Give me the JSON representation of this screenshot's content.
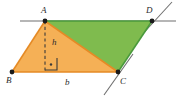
{
  "figure": {
    "name": "parallelogram-area-diagram",
    "background_color": "#ffffff"
  },
  "colors": {
    "orange_fill": "#f5b056",
    "orange_stroke": "#e58a25",
    "green_fill": "#7fbb4e",
    "green_stroke": "#4a9a3c",
    "guide_line": "#6f6f6f",
    "dashed_line": "#3a3a3a",
    "label_color": "#2b2b2b",
    "vertex_dot": "#1a1a1a"
  },
  "vertices": [
    {
      "id": "A",
      "label": "A",
      "x": 45,
      "y": 21
    },
    {
      "id": "B",
      "label": "B",
      "x": 12,
      "y": 72
    },
    {
      "id": "C",
      "label": "C",
      "x": 118,
      "y": 72
    },
    {
      "id": "D",
      "label": "D",
      "x": 152,
      "y": 21
    }
  ],
  "measures": {
    "height_label": "h",
    "base_label": "b",
    "foot_point": {
      "x": 45,
      "y": 72
    },
    "right_angle_marker": true
  },
  "regions": [
    {
      "id": "triangle-abc",
      "label": "A",
      "fill": "#f5b056",
      "points": "45,21 12,72 118,72"
    },
    {
      "id": "triangle-acd",
      "label": "D",
      "fill": "#7fbb4e",
      "points": "45,21 118,72 152,21"
    }
  ],
  "guides": [
    {
      "id": "top-line",
      "x1": 20,
      "y1": 21,
      "x2": 176,
      "y2": 21
    },
    {
      "id": "line-through-c",
      "x1": 104,
      "y1": 95,
      "x2": 133,
      "y2": 54
    },
    {
      "id": "line-through-d",
      "x1": 139,
      "y1": 38,
      "x2": 172,
      "y2": 2
    }
  ]
}
